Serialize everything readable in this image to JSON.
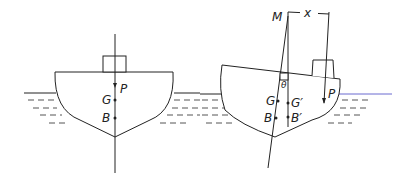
{
  "diagram": {
    "left_ship": {
      "labels": {
        "P": "P",
        "G": "G",
        "B": "B"
      }
    },
    "right_ship": {
      "labels": {
        "M": "M",
        "x": "x",
        "theta": "θ",
        "P": "P",
        "G": "G",
        "G_prime": "G′",
        "B": "B",
        "B_prime": "B′"
      }
    },
    "colors": {
      "line": "#222222",
      "waterline": "#444444",
      "waterline_accent": "#6a6ad0"
    }
  }
}
